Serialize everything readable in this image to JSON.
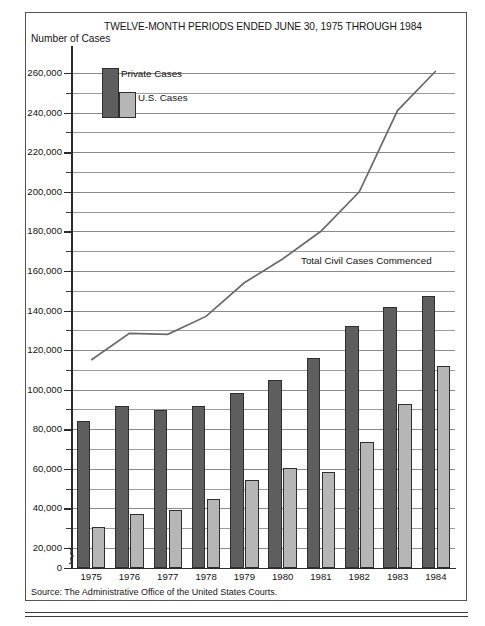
{
  "figure": {
    "title": "TWELVE-MONTH PERIODS ENDED JUNE 30, 1975 THROUGH 1984",
    "y_axis_title": "Number of Cases",
    "source": "Source: The Administrative Office of the United States Courts."
  },
  "legend": {
    "private_label": "Private Cases",
    "us_label": "U.S. Cases",
    "private_color": "#5e5e5e",
    "us_color": "#b6b6b6"
  },
  "annotations": {
    "line_label": "Total Civil Cases Commenced"
  },
  "chart_data": {
    "type": "bar",
    "title": "TWELVE-MONTH PERIODS ENDED JUNE 30, 1975 THROUGH 1984",
    "xlabel": "",
    "ylabel": "Number of Cases",
    "ylim": [
      0,
      260000
    ],
    "y_major_ticks": [
      0,
      20000,
      40000,
      60000,
      80000,
      100000,
      120000,
      140000,
      160000,
      180000,
      200000,
      220000,
      240000,
      260000
    ],
    "y_tick_labels": [
      "0",
      "20,000",
      "40,000",
      "60,000",
      "80,000",
      "100,000",
      "120,000",
      "140,000",
      "160,000",
      "180,000",
      "200,000",
      "220,000",
      "240,000",
      "260,000"
    ],
    "y_minor_tick_interval": 10000,
    "grid": true,
    "axis_break_between": [
      0,
      20000
    ],
    "legend_position": "top-left-inside",
    "categories": [
      "1975",
      "1976",
      "1977",
      "1978",
      "1979",
      "1980",
      "1981",
      "1982",
      "1983",
      "1984"
    ],
    "series": [
      {
        "name": "Private Cases",
        "type": "bar",
        "color": "#5e5e5e",
        "values": [
          84000,
          91500,
          89500,
          91500,
          98500,
          105000,
          116000,
          132000,
          142000,
          147500
        ]
      },
      {
        "name": "U.S. Cases",
        "type": "bar",
        "color": "#b6b6b6",
        "values": [
          30500,
          37000,
          39000,
          45000,
          54500,
          60500,
          58500,
          73500,
          93000,
          112000
        ]
      },
      {
        "name": "Total Civil Cases Commenced",
        "type": "line",
        "color": "#6a6a6a",
        "values": [
          115000,
          128500,
          128000,
          137000,
          154000,
          166000,
          180000,
          200000,
          241000,
          261000
        ]
      }
    ]
  }
}
